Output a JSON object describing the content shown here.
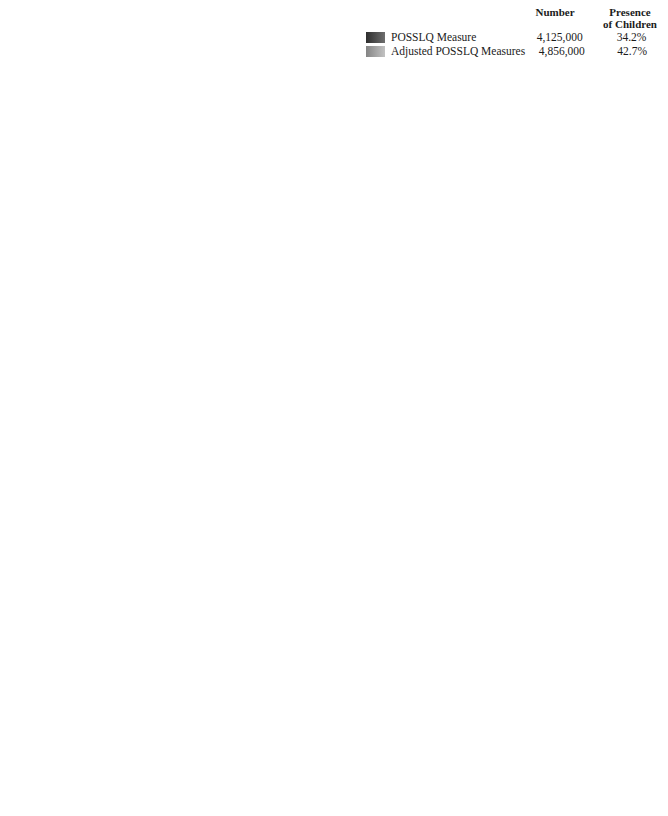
{
  "legend": {
    "col_number": "Number",
    "col_children_line1": "Presence",
    "col_children_line2": "of Children",
    "rows": [
      {
        "label": "POSSLQ Measure",
        "number": "4,125,000",
        "children": "34.2%",
        "swatch": "dark"
      },
      {
        "label": "Adjusted POSSLQ Measures",
        "number": "4,856,000",
        "children": "42.7%",
        "swatch": "light"
      }
    ]
  },
  "series_names": [
    "POSSLQ Measure",
    "Adjusted POSSLQ Measures"
  ],
  "axis_title": "Percent",
  "chart_data": [
    {
      "id": "age",
      "type": "bar",
      "orientation": "horizontal",
      "title": "",
      "xlabel": "Percent",
      "ylabel": "",
      "xlim": [
        0,
        60
      ],
      "xticks": [
        0,
        10,
        20,
        30,
        40,
        50,
        60
      ],
      "grid": true,
      "legend_position": "top-right (shared)",
      "groups": [
        {
          "heading_line1": "Age of",
          "heading_line2": "Female Partner",
          "categories": [
            "15–24 years",
            "25–34 years",
            "35–44 years",
            "45–54 years",
            "55–64 years",
            "65+ years"
          ],
          "series": [
            {
              "name": "POSSLQ Measure",
              "values": [
                25.7,
                38.0,
                17.0,
                10.4,
                5.4,
                3.5
              ]
            },
            {
              "name": "Adjusted POSSLQ Measures",
              "values": [
                23.7,
                34.7,
                20.6,
                12.1,
                5.5,
                3.3
              ]
            }
          ]
        },
        {
          "heading_line1": "Age of",
          "heading_line2": "Male Partner",
          "categories": [
            "15–24 years",
            "25–34 years",
            "35–44 years",
            "45–54 years",
            "55–64 years",
            "65+ years"
          ],
          "series": [
            {
              "name": "POSSLQ Measure",
              "values": [
                15.8,
                41.5,
                21.4,
                10.2,
                6.2,
                5.0
              ]
            },
            {
              "name": "Adjusted POSSLQ Measures",
              "values": [
                14.6,
                38.2,
                23.6,
                12.2,
                6.6,
                4.8
              ]
            }
          ]
        }
      ]
    },
    {
      "id": "education",
      "type": "bar",
      "orientation": "horizontal",
      "title": "",
      "xlabel": "Percent",
      "ylabel": "",
      "xlim": [
        0,
        50
      ],
      "xticks": [
        0,
        10,
        20,
        30,
        40,
        50
      ],
      "grid": true,
      "legend_position": "top-right (shared)",
      "groups": [
        {
          "heading_line1": "Education of",
          "heading_line2": "Female Partner",
          "categories": [
            "0–11 years",
            "12 years",
            "13–15 years",
            "16+ years"
          ],
          "series": [
            {
              "name": "POSSLQ Measure",
              "values": [
                14.2,
                37.5,
                30.6,
                17.7
              ]
            },
            {
              "name": "Adjusted POSSLQ Measures",
              "values": [
                16.1,
                38.3,
                29.4,
                16.2
              ]
            }
          ]
        },
        {
          "heading_line1": "Education of",
          "heading_line2": "Male Partner",
          "categories": [
            "0–11 years",
            "12 years",
            "13–15 years",
            "16+ years"
          ],
          "series": [
            {
              "name": "POSSLQ Measure",
              "values": [
                15.3,
                41.0,
                25.6,
                18.1
              ]
            },
            {
              "name": "Adjusted POSSLQ Measures",
              "values": [
                16.6,
                42.0,
                24.6,
                16.8
              ]
            }
          ]
        }
      ]
    },
    {
      "id": "marital",
      "type": "bar",
      "orientation": "horizontal",
      "title": "",
      "xlabel": "Percent",
      "ylabel": "",
      "xlim": [
        0,
        70
      ],
      "xticks": [
        0,
        10,
        20,
        30,
        40,
        50,
        60,
        70
      ],
      "grid": true,
      "legend_position": "top-right (shared)",
      "groups": [
        {
          "heading_line1": "Marital Status of",
          "heading_line2": "Female Partner",
          "categories": [
            "Married",
            "Separated",
            "Widowed",
            "Divorced",
            "Never Married"
          ],
          "series": [
            {
              "name": "POSSLQ Measure",
              "values": [
                2.7,
                4.3,
                5.0,
                32.0,
                56.0
              ]
            },
            {
              "name": "Adjusted POSSLQ Measures",
              "values": [
                2.7,
                4.9,
                5.8,
                34.2,
                52.5
              ]
            }
          ]
        },
        {
          "heading_line1": "Marital Status of",
          "heading_line2": "Male Partner",
          "categories": [
            "Married",
            "Separated",
            "Widowed",
            "Divorced",
            "Never Married"
          ],
          "series": [
            {
              "name": "POSSLQ Measure",
              "values": [
                3.1,
                4.3,
                3.3,
                30.3,
                58.9
              ]
            },
            {
              "name": "Adjusted POSSLQ Measures",
              "values": [
                3.0,
                4.6,
                3.3,
                33.1,
                56.0
              ]
            }
          ]
        }
      ]
    },
    {
      "id": "race",
      "type": "bar",
      "orientation": "horizontal",
      "title": "",
      "xlabel": "Percent",
      "ylabel": "",
      "xlim": [
        0,
        80
      ],
      "xticks": [
        0,
        10,
        20,
        30,
        40,
        50,
        60,
        70,
        80
      ],
      "grid": true,
      "legend_position": "top-right (shared)",
      "groups": [
        {
          "heading_line1": "Race/Ethnicity of",
          "heading_line2": "Female Partner",
          "categories": [
            "White",
            "Black",
            "Hispanic",
            "Other"
          ],
          "series": [
            {
              "name": "POSSLQ Measure",
              "values": [
                75.3,
                12.7,
                8.6,
                3.4
              ]
            },
            {
              "name": "Adjusted POSSLQ Measures",
              "values": [
                73.6,
                13.4,
                9.6,
                3.4
              ]
            }
          ]
        },
        {
          "heading_line1": "Race/Ethnicity of",
          "heading_line2": "Male Partner",
          "categories": [
            "White",
            "Black",
            "Hispanic",
            "Other"
          ],
          "series": [
            {
              "name": "POSSLQ Measure",
              "values": [
                72.7,
                15.3,
                9.5,
                2.5
              ]
            },
            {
              "name": "Adjusted POSSLQ Measures",
              "values": [
                71.1,
                16.0,
                10.4,
                2.6
              ]
            }
          ]
        }
      ]
    }
  ],
  "layout": {
    "charts": [
      {
        "id": "age",
        "plot_left": 98,
        "plot_top": 12,
        "plot_width": 216,
        "label_right": 92,
        "head_gap": 28,
        "row_h": 37,
        "group_gap": 8,
        "bar_gap": 1
      },
      {
        "id": "education",
        "plot_left": 427,
        "plot_top": 112,
        "plot_width": 228,
        "label_right": 421,
        "head_gap": 28,
        "row_h": 37,
        "group_gap": 8,
        "bar_gap": 1
      },
      {
        "id": "marital",
        "plot_left": 98,
        "plot_top": 442,
        "plot_width": 216,
        "label_right": 92,
        "head_gap": 28,
        "row_h": 36,
        "group_gap": 6,
        "bar_gap": 1
      },
      {
        "id": "race",
        "plot_left": 427,
        "plot_top": 442,
        "plot_width": 228,
        "label_right": 421,
        "head_gap": 28,
        "row_h": 38,
        "group_gap": 8,
        "bar_gap": 1
      }
    ]
  }
}
